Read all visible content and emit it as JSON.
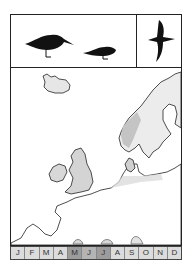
{
  "plate": {
    "header": {
      "icons": [
        {
          "name": "large-wader-silhouette"
        },
        {
          "name": "small-wader-silhouette"
        },
        {
          "name": "bird-in-flight-silhouette"
        }
      ]
    },
    "map": {
      "region": "Northern Europe",
      "range_fill_color": "#cfcfcf",
      "range_highlight_color": "#e8e8e8",
      "coast_color": "#222222"
    },
    "months": [
      {
        "label": "J",
        "shade": "light"
      },
      {
        "label": "F",
        "shade": "light"
      },
      {
        "label": "M",
        "shade": "light"
      },
      {
        "label": "A",
        "shade": "light"
      },
      {
        "label": "M",
        "shade": "dark"
      },
      {
        "label": "J",
        "shade": "mid"
      },
      {
        "label": "J",
        "shade": "dark"
      },
      {
        "label": "A",
        "shade": "light"
      },
      {
        "label": "S",
        "shade": "light"
      },
      {
        "label": "O",
        "shade": "light"
      },
      {
        "label": "N",
        "shade": "light"
      },
      {
        "label": "D",
        "shade": "light"
      }
    ]
  }
}
